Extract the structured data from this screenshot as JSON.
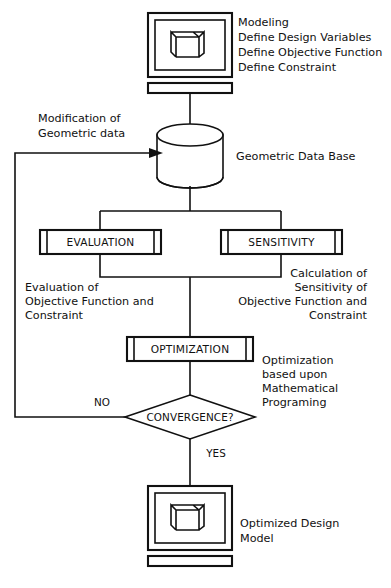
{
  "diagram": {
    "type": "flowchart",
    "colors": {
      "stroke": "#111111",
      "background": "#ffffff"
    },
    "nodes": {
      "modeling_monitor": {
        "shape": "monitor",
        "icon_name": "channel-beam-3d-icon",
        "annotation_lines": [
          "Modeling",
          "Define Design Variables",
          "Define Objective Function",
          "Define Constraint"
        ]
      },
      "database": {
        "shape": "cylinder",
        "label": "Geometric Data Base"
      },
      "evaluation": {
        "shape": "process",
        "label": "EVALUATION",
        "annotation_lines": [
          "Evaluation of",
          "Objective Function and",
          "Constraint"
        ]
      },
      "sensitivity": {
        "shape": "process",
        "label": "SENSITIVITY",
        "annotation_lines": [
          "Calculation of",
          "Sensitivity of",
          "Objective Function and",
          "Constraint"
        ]
      },
      "optimization": {
        "shape": "process",
        "label": "OPTIMIZATION",
        "annotation_lines": [
          "Optimization",
          "based upon",
          "Mathematical",
          "Programing"
        ]
      },
      "convergence": {
        "shape": "diamond",
        "label": "CONVERGENCE?",
        "branch_no": "NO",
        "branch_yes": "YES"
      },
      "result_monitor": {
        "shape": "monitor",
        "icon_name": "channel-beam-3d-icon",
        "annotation_lines": [
          "Optimized Design",
          "Model"
        ]
      }
    },
    "edges": {
      "feedback_label_lines": [
        "Modification of",
        "Geometric data"
      ]
    }
  }
}
